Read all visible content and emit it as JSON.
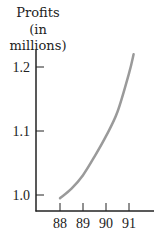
{
  "chart_data": {
    "type": "line",
    "title": "",
    "ylabel": "Profits (in millions)",
    "ylabel_lines": [
      "Profits",
      "(in millions)"
    ],
    "xlabel": "",
    "x_ticks": [
      "88",
      "89",
      "90",
      "91"
    ],
    "x_tick_values": [
      88,
      89,
      90,
      91
    ],
    "y_ticks": [
      "1.0",
      "1.1",
      "1.2"
    ],
    "y_tick_values": [
      1.0,
      1.1,
      1.2
    ],
    "xlim": [
      87,
      92
    ],
    "ylim": [
      0.97,
      1.25
    ],
    "grid": false,
    "series": [
      {
        "name": "Profits",
        "color": "#9a9a9a",
        "x": [
          88,
          88.5,
          89,
          89.5,
          90,
          90.5,
          91,
          91.2
        ],
        "y": [
          0.995,
          1.01,
          1.031,
          1.06,
          1.092,
          1.13,
          1.19,
          1.22
        ]
      }
    ],
    "axis_color": "#222222"
  }
}
